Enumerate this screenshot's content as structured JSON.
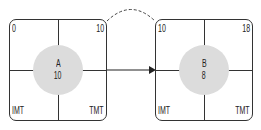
{
  "diagram": {
    "nodes": [
      {
        "id": "A",
        "center_label": "A",
        "center_value": "10",
        "top_left": "0",
        "top_right": "10",
        "bottom_left": "IMT",
        "bottom_right": "TMT"
      },
      {
        "id": "B",
        "center_label": "B",
        "center_value": "8",
        "top_left": "10",
        "top_right": "18",
        "bottom_left": "IMT",
        "bottom_right": "TMT"
      }
    ],
    "edges": [
      {
        "from": "A",
        "to": "B",
        "style": "solid",
        "arrow": true
      },
      {
        "from": "A",
        "to": "B",
        "style": "dashed",
        "arrow": false,
        "note": "top-right corner to top-left corner"
      }
    ],
    "colors": {
      "stroke": "#333333",
      "circle_fill": "#dcdcdc",
      "text": "#222222"
    }
  }
}
